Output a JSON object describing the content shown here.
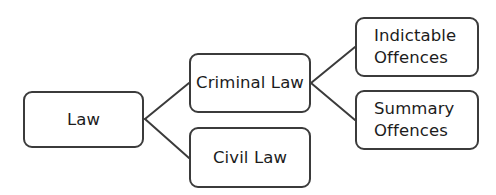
{
  "diagram": {
    "type": "hierarchy-tree",
    "orientation": "left-to-right",
    "background_color": "#ffffff",
    "node_border_color": "#3b3b3b",
    "node_fill_color": "#ffffff",
    "connector_color": "#3b3b3b",
    "text_color": "#1c1c1c",
    "nodes": [
      {
        "id": "law",
        "label": "Law",
        "level": 0
      },
      {
        "id": "criminal",
        "label": "Criminal Law",
        "level": 1
      },
      {
        "id": "civil",
        "label": "Civil Law",
        "level": 1
      },
      {
        "id": "indictable",
        "label": "Indictable\nOffences",
        "level": 2
      },
      {
        "id": "summary",
        "label": "Summary\nOffences",
        "level": 2
      }
    ],
    "edges": [
      {
        "from": "law",
        "to": "criminal"
      },
      {
        "from": "law",
        "to": "civil"
      },
      {
        "from": "criminal",
        "to": "indictable"
      },
      {
        "from": "criminal",
        "to": "summary"
      }
    ]
  }
}
